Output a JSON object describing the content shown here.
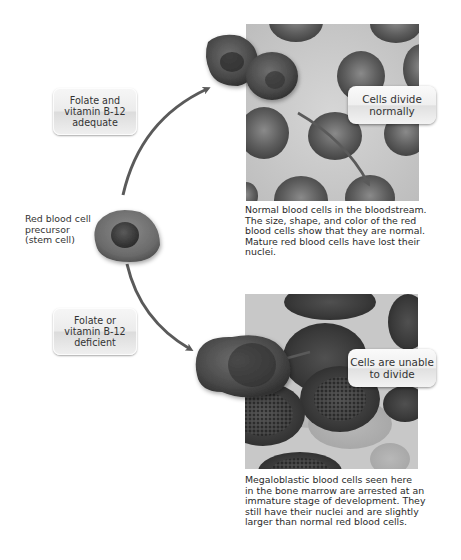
{
  "diagram": {
    "stem_cell": {
      "label_lines": [
        "Red blood cell",
        "precursor",
        "(stem cell)"
      ]
    },
    "pathway_adequate": {
      "condition_lines": [
        "Folate and",
        "vitamin B-12",
        "adequate"
      ],
      "callout_lines": [
        "Cells divide",
        "normally"
      ],
      "caption_lines": [
        "Normal blood cells in the bloodstream.",
        "The size, shape, and color of the red",
        "blood cells show that they are normal.",
        "Mature red blood cells have lost their",
        "nuclei."
      ]
    },
    "pathway_deficient": {
      "condition_lines": [
        "Folate or",
        "vitamin B-12",
        "deficient"
      ],
      "callout_lines": [
        "Cells are unable",
        "to divide"
      ],
      "caption_lines": [
        "Megaloblastic blood cells seen here",
        "in the bone marrow are arrested at an",
        "immature stage of development. They",
        "still have their nuclei and are slightly",
        "larger than normal red blood cells."
      ]
    },
    "colors": {
      "arrow": "#5a5a5a",
      "cell_dark": "#3c3c3c",
      "cell_mid": "#6a6a6a",
      "micro_bg": "#c8c8c8",
      "label_bg": "#ececec"
    }
  }
}
